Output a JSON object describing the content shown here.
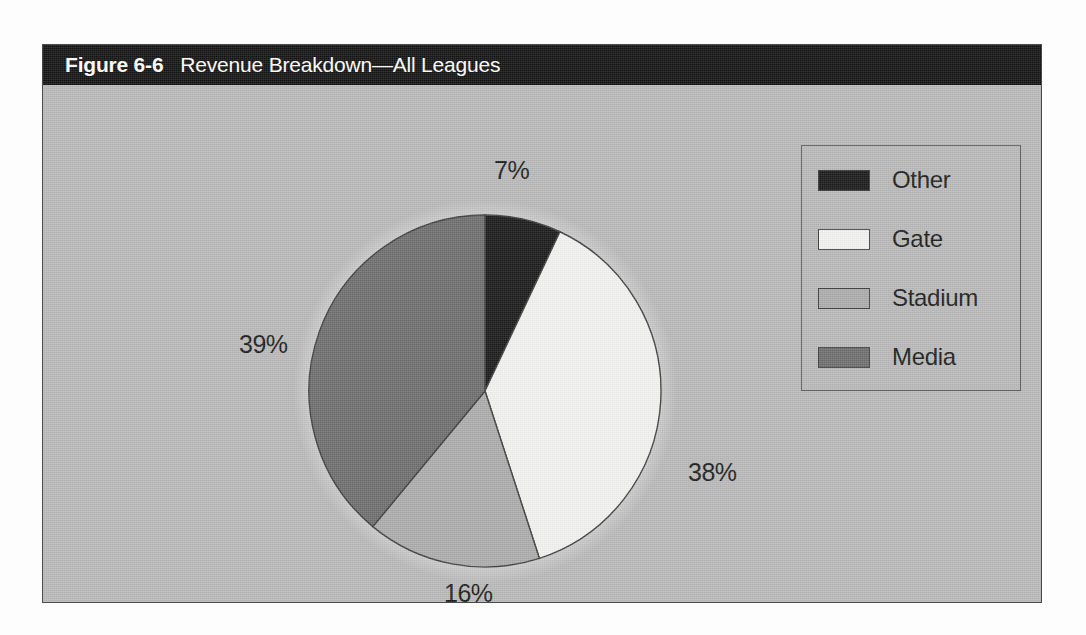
{
  "figure": {
    "number": "Figure 6-6",
    "caption": "Revenue Breakdown—All Leagues"
  },
  "legend": {
    "position": "top-right",
    "items": [
      {
        "label": "Other",
        "color": "#1a1a1a"
      },
      {
        "label": "Gate",
        "color": "#f2f2f0"
      },
      {
        "label": "Stadium",
        "color": "#acacac"
      },
      {
        "label": "Media",
        "color": "#6e6e6e"
      }
    ]
  },
  "labels": {
    "other": "7%",
    "gate": "38%",
    "stadium": "16%",
    "media": "39%"
  },
  "colors": {
    "panel_background": "#b9b9b9",
    "header_background": "#131313",
    "header_text": "#ffffff",
    "outline": "#3f3f3f",
    "halo": "#d2d2d2"
  },
  "chart_data": {
    "type": "pie",
    "title": "Revenue Breakdown—All Leagues",
    "xlabel": "",
    "ylabel": "",
    "start_angle_deg": 0,
    "direction": "clockwise",
    "grid": false,
    "legend_position": "top-right",
    "categories": [
      "Other",
      "Gate",
      "Stadium",
      "Media"
    ],
    "values": [
      7,
      38,
      16,
      39
    ],
    "value_labels": [
      "7%",
      "38%",
      "16%",
      "39%"
    ],
    "units": "percent",
    "total": 100,
    "slice_colors": [
      "#1a1a1a",
      "#f2f2f0",
      "#acacac",
      "#6e6e6e"
    ],
    "slices": [
      {
        "name": "Other",
        "value": 7,
        "label": "7%",
        "color": "#1a1a1a"
      },
      {
        "name": "Gate",
        "value": 38,
        "label": "38%",
        "color": "#f2f2f0"
      },
      {
        "name": "Stadium",
        "value": 16,
        "label": "16%",
        "color": "#acacac"
      },
      {
        "name": "Media",
        "value": 39,
        "label": "39%",
        "color": "#6e6e6e"
      }
    ]
  }
}
